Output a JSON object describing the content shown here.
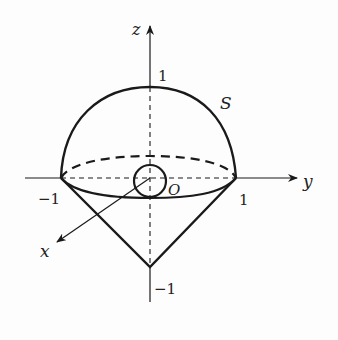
{
  "figure": {
    "type": "3d-surface-diagram",
    "colors": {
      "stroke": "#1a1a1a",
      "background": "#fdfdfd"
    },
    "axes": {
      "z": {
        "label": "z",
        "ticks": [
          {
            "value": "1"
          },
          {
            "value": "−1"
          }
        ]
      },
      "y": {
        "label": "y",
        "ticks": [
          {
            "value": "−1"
          },
          {
            "value": "1"
          }
        ]
      },
      "x": {
        "label": "x"
      }
    },
    "labels": {
      "surface": "S",
      "origin": "O",
      "z_top": "1",
      "z_bottom": "−1",
      "y_left": "−1",
      "y_right": "1",
      "z_axis": "z",
      "y_axis": "y",
      "x_axis": "x"
    },
    "elements": [
      {
        "name": "upper-hemisphere",
        "style": "solid"
      },
      {
        "name": "equator-back",
        "style": "dashed"
      },
      {
        "name": "equator-front",
        "style": "solid"
      },
      {
        "name": "cone",
        "apex_z": -1,
        "style": "solid"
      },
      {
        "name": "small-sphere-at-origin",
        "style": "solid"
      }
    ]
  }
}
